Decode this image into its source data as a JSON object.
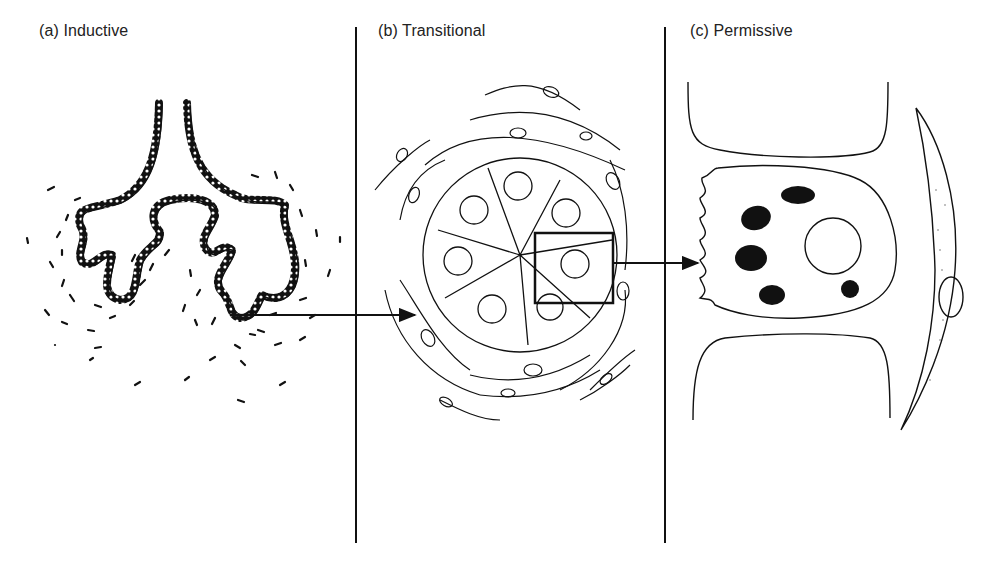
{
  "panels": [
    {
      "id": "a",
      "label": "(a)  Inductive",
      "subject": "branching epithelial bud in mesenchyme"
    },
    {
      "id": "b",
      "label": "(b)  Transitional",
      "subject": "cross-section of epithelial tubule surrounded by fibroblast layer"
    },
    {
      "id": "c",
      "label": "(c)  Permissive",
      "subject": "single epithelial cell with granules between neighbours, adjacent fibroblast"
    }
  ],
  "colors": {
    "ink": "#111111",
    "background": "#ffffff"
  },
  "arrows": [
    {
      "from": "a",
      "to": "b",
      "y": 315
    },
    {
      "from": "b",
      "to": "c",
      "y": 263
    }
  ]
}
